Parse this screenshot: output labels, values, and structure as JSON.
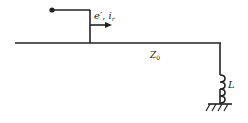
{
  "diagram": {
    "wave_label": {
      "e": "e",
      "prime": "′",
      "sep": ", ",
      "i": "i",
      "sub": "r"
    },
    "line_label": {
      "main": "Z",
      "sub": "0"
    },
    "inductor_label": "L",
    "line_color": "#222222"
  }
}
